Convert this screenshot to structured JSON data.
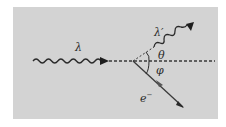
{
  "diagram": {
    "background_color": "#d3d3d3",
    "stroke_color": "#2a2a2a",
    "incident_photon": {
      "label": "λ",
      "type": "wavy-arrow"
    },
    "scattered_photon": {
      "label": "λ′",
      "type": "wavy-arrow"
    },
    "scattering_angle": {
      "label": "θ"
    },
    "recoil_angle": {
      "label": "φ"
    },
    "electron": {
      "label": "e",
      "charge": "−",
      "type": "arrow"
    },
    "reference_axis": {
      "type": "dashed-line"
    }
  }
}
